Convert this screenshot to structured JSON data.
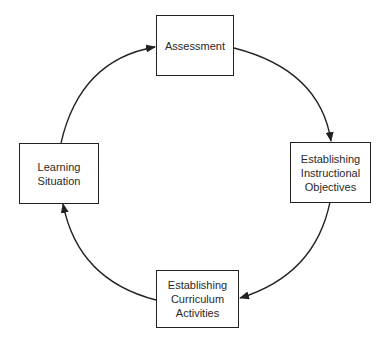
{
  "diagram": {
    "type": "cycle",
    "direction": "clockwise",
    "colors": {
      "stroke": "#222222",
      "text": "#2a2a2a",
      "background": "#ffffff"
    },
    "nodes": [
      {
        "id": "assessment",
        "lines": [
          "Assessment"
        ]
      },
      {
        "id": "instructional-objectives",
        "lines": [
          "Establishing",
          "Instructional",
          "Objectives"
        ]
      },
      {
        "id": "curriculum-activities",
        "lines": [
          "Establishing",
          "Curriculum",
          "Activities"
        ]
      },
      {
        "id": "learning-situation",
        "lines": [
          "Learning",
          "Situation"
        ]
      }
    ],
    "edges": [
      {
        "from": "assessment",
        "to": "instructional-objectives"
      },
      {
        "from": "instructional-objectives",
        "to": "curriculum-activities"
      },
      {
        "from": "curriculum-activities",
        "to": "learning-situation"
      },
      {
        "from": "learning-situation",
        "to": "assessment"
      }
    ]
  }
}
